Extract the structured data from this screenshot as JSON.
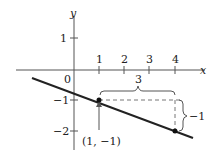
{
  "axes": {
    "x_label": "x",
    "y_label": "y",
    "origin_label": "0"
  },
  "x_ticks": [
    "1",
    "2",
    "3",
    "4"
  ],
  "y_ticks": [
    "1",
    "−1",
    "−2"
  ],
  "points": [
    {
      "label": "(1, −1)",
      "x": 1,
      "y": -1
    },
    {
      "x": 4,
      "y": -2
    }
  ],
  "line": {
    "slope": "-1/3",
    "color": "#222222"
  },
  "run_label": "3",
  "rise_label": "−1"
}
